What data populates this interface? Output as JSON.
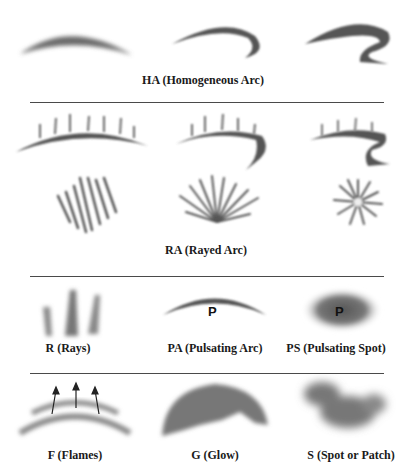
{
  "sections": [
    {
      "id": "ha",
      "label": "HA (Homogeneous Arc)",
      "examples": [
        "homogeneous-arc",
        "homogeneous-arc-folded",
        "homogeneous-arc-double-fold"
      ]
    },
    {
      "id": "ra",
      "label": "RA (Rayed Arc)",
      "examples": [
        "rayed-arc",
        "rayed-arc-folded",
        "rayed-arc-double-fold",
        "rayed-band-oblique",
        "rayed-fan",
        "corona"
      ]
    },
    {
      "id": "row3",
      "items": [
        {
          "id": "r",
          "label": "R (Rays)"
        },
        {
          "id": "pa",
          "label": "PA (Pulsating Arc)",
          "mark": "P"
        },
        {
          "id": "ps",
          "label": "PS (Pulsating Spot)",
          "mark": "P"
        }
      ]
    },
    {
      "id": "row4",
      "items": [
        {
          "id": "f",
          "label": "F (Flames)"
        },
        {
          "id": "g",
          "label": "G (Glow)"
        },
        {
          "id": "s",
          "label": "S (Spot or Patch)"
        }
      ]
    }
  ],
  "colors": {
    "ink": "#1a1a1a",
    "rule": "#4a4a4a",
    "aurora": "#5a5a5a"
  }
}
